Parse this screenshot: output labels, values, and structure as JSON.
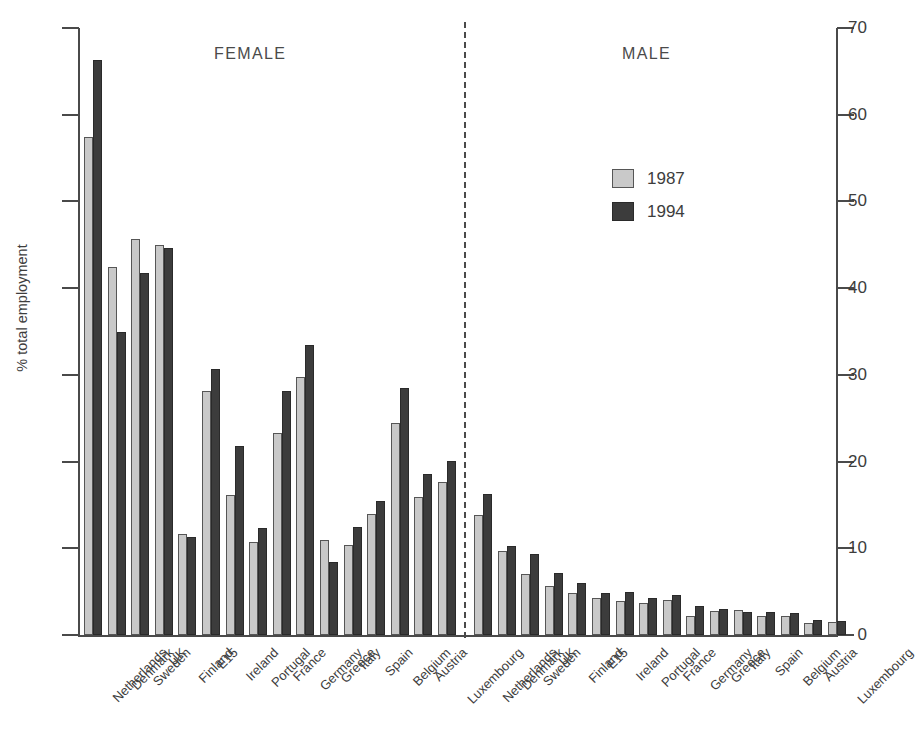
{
  "chart_data": {
    "type": "bar",
    "title": "",
    "subtitle": "",
    "xlabel": "",
    "ylabel": "% total employment",
    "ylim": [
      0,
      70
    ],
    "ytick_values": [
      0,
      10,
      20,
      30,
      40,
      50,
      60,
      70
    ],
    "ytick_labels": [
      "0",
      "10",
      "20",
      "30",
      "40",
      "50",
      "60",
      "70"
    ],
    "grid": false,
    "legend_position": "upper-right-inside",
    "legend": [
      "1987",
      "1994"
    ],
    "series_colors": {
      "1987": "#c9c9c9",
      "1994": "#3c3c3c"
    },
    "annotations": [
      "FEMALE",
      "MALE"
    ],
    "panels": [
      {
        "name": "FEMALE",
        "categories": [
          "Netherlands",
          "Denmark",
          "Sweden",
          "UK",
          "Finland",
          "E15",
          "Ireland",
          "Portugal",
          "France",
          "Germany",
          "Greece",
          "Italy",
          "Spain",
          "Belgium",
          "Austria",
          "Luxembourg"
        ],
        "series": [
          {
            "name": "1987",
            "values": [
              57.4,
              42.4,
              45.7,
              45.0,
              11.6,
              28.1,
              16.2,
              10.7,
              23.3,
              29.8,
              11.0,
              10.4,
              14.0,
              24.4,
              15.9,
              17.6
            ]
          },
          {
            "name": "1994",
            "values": [
              66.3,
              34.9,
              41.8,
              44.6,
              11.3,
              30.7,
              21.8,
              12.3,
              28.1,
              33.4,
              8.4,
              12.5,
              15.5,
              28.5,
              18.6,
              20.1
            ]
          }
        ]
      },
      {
        "name": "MALE",
        "categories": [
          "Netherlands",
          "Denmark",
          "Sweden",
          "UK",
          "Finland",
          "E15",
          "Ireland",
          "Portugal",
          "France",
          "Germany",
          "Greece",
          "Italy",
          "Spain",
          "Belgium",
          "Austria",
          "Luxembourg"
        ],
        "series": [
          {
            "name": "1987",
            "values": [
              13.8,
              9.7,
              7.0,
              5.6,
              4.9,
              4.3,
              3.9,
              3.7,
              4.0,
              2.2,
              2.8,
              2.9,
              2.2,
              2.2,
              1.4,
              1.5
            ]
          },
          {
            "name": "1994",
            "values": [
              16.3,
              10.3,
              9.4,
              7.2,
              6.0,
              4.8,
              5.0,
              4.3,
              4.6,
              3.3,
              3.0,
              2.6,
              2.7,
              2.5,
              1.7,
              1.6
            ]
          }
        ]
      }
    ]
  },
  "axis": {
    "y_title": "% total employment",
    "ticks": [
      "70",
      "60",
      "50",
      "40",
      "30",
      "20",
      "10",
      "0"
    ]
  },
  "headings": {
    "female": "FEMALE",
    "male": "MALE"
  },
  "legend": {
    "items": [
      {
        "label": "1987",
        "color": "#c9c9c9"
      },
      {
        "label": "1994",
        "color": "#3c3c3c"
      }
    ]
  }
}
